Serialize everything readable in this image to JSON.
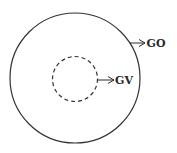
{
  "diagram": {
    "outer_circle": {
      "label": "GO",
      "style": "solid",
      "color": "#333333"
    },
    "inner_circle": {
      "label": "GV",
      "style": "dashed",
      "color": "#333333"
    }
  }
}
